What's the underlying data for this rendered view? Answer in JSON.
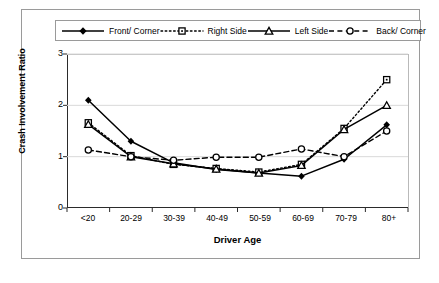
{
  "chart_data": {
    "type": "line",
    "title": "",
    "xlabel": "Driver Age",
    "ylabel": "Crash Involvement Ratio",
    "categories": [
      "<20",
      "20-29",
      "30-39",
      "40-49",
      "50-59",
      "60-69",
      "70-79",
      "80+"
    ],
    "ylim": [
      0,
      3
    ],
    "yticks": [
      "0",
      "1",
      "2",
      "3"
    ],
    "grid": "horizontal",
    "legend_position": "top",
    "series": [
      {
        "name": "Front/ Corner",
        "marker": "filled-diamond",
        "line": "solid",
        "values": [
          2.1,
          1.3,
          0.88,
          0.75,
          0.68,
          0.62,
          0.95,
          1.62
        ]
      },
      {
        "name": "Right Side",
        "marker": "open-square",
        "line": "dotted",
        "values": [
          1.66,
          1.02,
          0.85,
          0.77,
          0.7,
          0.85,
          1.55,
          2.5
        ]
      },
      {
        "name": "Left Side",
        "marker": "triangle",
        "line": "solid",
        "values": [
          1.63,
          1.0,
          0.86,
          0.76,
          0.68,
          0.83,
          1.53,
          2.0
        ]
      },
      {
        "name": "Back/ Corner",
        "marker": "open-circle",
        "line": "dashed",
        "values": [
          1.13,
          1.0,
          0.93,
          0.99,
          0.99,
          1.15,
          1.0,
          1.5
        ]
      }
    ]
  },
  "legend": {
    "items": [
      {
        "label": "Front/ Corner"
      },
      {
        "label": "Right Side"
      },
      {
        "label": "Left Side"
      },
      {
        "label": "Back/ Corner"
      }
    ]
  },
  "axes": {
    "y_label": "Crash Involvement Ratio",
    "x_label": "Driver Age",
    "y_ticks": [
      "3",
      "2",
      "1",
      "0"
    ],
    "x_ticks": [
      "<20",
      "20-29",
      "30-39",
      "40-49",
      "50-59",
      "60-69",
      "70-79",
      "80+"
    ]
  },
  "colors": {
    "line": "#000000",
    "grid": "#d9d9d9",
    "axis": "#2b2b2b",
    "frame": "#9a9a9a",
    "background": "#ffffff"
  }
}
